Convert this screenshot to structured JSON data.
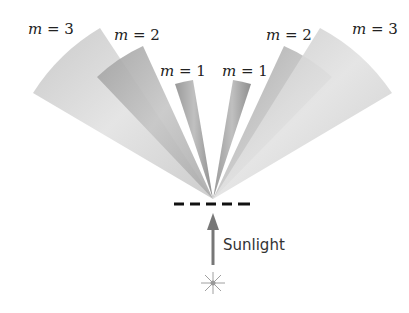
{
  "diagram": {
    "orders": [
      {
        "side": "left",
        "label_var": "m",
        "label_eq": " = 3"
      },
      {
        "side": "left",
        "label_var": "m",
        "label_eq": " = 2"
      },
      {
        "side": "left",
        "label_var": "m",
        "label_eq": " = 1"
      },
      {
        "side": "right",
        "label_var": "m",
        "label_eq": " = 1"
      },
      {
        "side": "right",
        "label_var": "m",
        "label_eq": " = 2"
      },
      {
        "side": "right",
        "label_var": "m",
        "label_eq": " = 3"
      }
    ],
    "source_label": "Sunlight",
    "colors": {
      "fan_light": "#d8d8d8",
      "fan_mid": "#a8a8a8",
      "fan_dark": "#8c8c8c",
      "grating": "#111111",
      "arrow": "#777777",
      "star": "#999999"
    }
  }
}
